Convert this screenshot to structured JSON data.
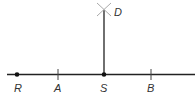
{
  "diagram": {
    "colors": {
      "line": "#222222",
      "arc_marks": "#aaaaaa",
      "label": "#333333"
    },
    "points": [
      {
        "name": "R",
        "label": "R",
        "x": 17,
        "type": "dot"
      },
      {
        "name": "A",
        "label": "A",
        "x": 58,
        "type": "tick"
      },
      {
        "name": "S",
        "label": "S",
        "x": 104,
        "type": "dot"
      },
      {
        "name": "B",
        "label": "B",
        "x": 151,
        "type": "tick"
      }
    ],
    "perpendicular": {
      "from": "S",
      "to": "D",
      "label": "D"
    }
  }
}
